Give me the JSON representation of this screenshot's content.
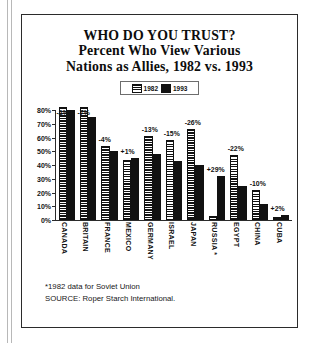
{
  "title": {
    "line1": "WHO DO YOU TRUST?",
    "line2": "Percent Who View Various",
    "line3": "Nations as Allies, 1982 vs. 1993"
  },
  "legend": {
    "entries": [
      {
        "label": "1982",
        "swatch": "striped-swatch-icon"
      },
      {
        "label": "1993",
        "swatch": "solid-black-swatch-icon"
      }
    ]
  },
  "footnotes": [
    "*1982 data for Soviet Union",
    "SOURCE: Roper Starch International."
  ],
  "colors": {
    "ink": "#111111",
    "paper": "#ffffff",
    "frame": "#2b2b2b",
    "gutter": "#b8b8b8"
  },
  "chart_data": {
    "type": "bar",
    "title": "WHO DO YOU TRUST? Percent Who View Various Nations as Allies, 1982 vs. 1993",
    "xlabel": "",
    "ylabel": "",
    "ylim": [
      0,
      80
    ],
    "ytick_labels": [
      "80%",
      "70%",
      "60%",
      "50%",
      "40%",
      "30%",
      "20%",
      "10%",
      "0%"
    ],
    "ytick_values": [
      80,
      70,
      60,
      50,
      40,
      30,
      20,
      10,
      0
    ],
    "grid": false,
    "legend_position": "top-center",
    "categories": [
      "CANADA",
      "BRITAIN",
      "FRANCE",
      "MEXICO",
      "GERMANY",
      "ISRAEL",
      "JAPAN",
      "RUSSIA *",
      "EGYPT",
      "CHINA",
      "CUBA"
    ],
    "series": [
      {
        "name": "1982",
        "values": [
          82,
          82,
          54,
          44,
          61,
          58,
          66,
          3,
          47,
          22,
          2
        ]
      },
      {
        "name": "1993",
        "values": [
          80,
          75,
          50,
          45,
          48,
          43,
          40,
          32,
          25,
          12,
          4
        ]
      }
    ],
    "annotations": [
      "-2%",
      "-7%",
      "-4%",
      "+1%",
      "-13%",
      "-15%",
      "-26%",
      "+29%",
      "-22%",
      "-10%",
      "+2%"
    ],
    "annotation_note": "Label above each country pair is the change from 1982 to 1993"
  }
}
